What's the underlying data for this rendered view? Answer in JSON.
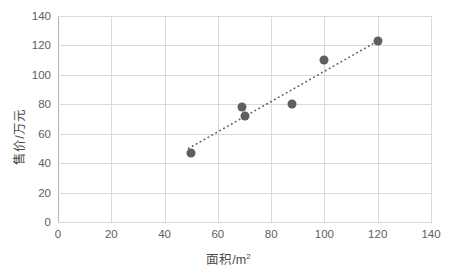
{
  "chart_data": {
    "type": "scatter",
    "title": "",
    "xlabel": "面积/m²",
    "xlabel_base": "面积/m",
    "xlabel_sup": "2",
    "ylabel": "售价/万元",
    "xlim": [
      0,
      140
    ],
    "ylim": [
      0,
      140
    ],
    "xticks": [
      0,
      20,
      40,
      60,
      80,
      100,
      120,
      140
    ],
    "yticks": [
      0,
      20,
      40,
      60,
      80,
      100,
      120,
      140
    ],
    "grid": "horizontal-and-vertical",
    "legend": "none",
    "marker_color": "#5f5f5f",
    "gridline_color": "#d9d9d9",
    "axis_color": "#b3b3b3",
    "points": [
      {
        "x": 50,
        "y": 47
      },
      {
        "x": 69,
        "y": 78
      },
      {
        "x": 70,
        "y": 72
      },
      {
        "x": 88,
        "y": 80
      },
      {
        "x": 100,
        "y": 110
      },
      {
        "x": 120,
        "y": 123
      }
    ],
    "series": [
      {
        "name": "售价",
        "x": [
          50,
          69,
          70,
          88,
          100,
          120
        ],
        "values": [
          47,
          78,
          72,
          80,
          110,
          123
        ]
      }
    ],
    "trendline": {
      "style": "dotted",
      "color": "#595959",
      "x_start": 49,
      "y_start": 50,
      "x_end": 121,
      "y_end": 124
    }
  }
}
